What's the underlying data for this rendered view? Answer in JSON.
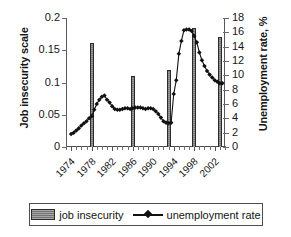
{
  "chart_data": {
    "type": "bar",
    "title": "",
    "subtitle": "",
    "xlabel": "",
    "ylabel": "Job insecurity scale",
    "y2label": "Unemployment rate, %",
    "grid": false,
    "legend_position": "bottom",
    "x_axis": {
      "tick_labels": [
        "1974",
        "1978",
        "1982",
        "1986",
        "1990",
        "1994",
        "1998",
        "2002"
      ],
      "tick_years": [
        1974,
        1978,
        1982,
        1986,
        1990,
        1994,
        1998,
        2002
      ],
      "range": [
        1973,
        2004
      ],
      "minor_tick_interval": 1
    },
    "y_axis_left": {
      "tick_labels": [
        "0",
        "0.05",
        "0.1",
        "0.15",
        "0.2"
      ],
      "tick_values": [
        0,
        0.05,
        0.1,
        0.15,
        0.2
      ],
      "ylim": [
        0,
        0.2
      ]
    },
    "y_axis_right": {
      "tick_labels": [
        "0",
        "2",
        "4",
        "6",
        "8",
        "10",
        "12",
        "14",
        "16",
        "18"
      ],
      "tick_values": [
        0,
        2,
        4,
        6,
        8,
        10,
        12,
        14,
        16,
        18
      ],
      "ylim": [
        0,
        18
      ]
    },
    "series": [
      {
        "name": "job insecurity",
        "type": "bar",
        "axis": "left",
        "x": [
          1978,
          1986,
          1993,
          1998,
          2003
        ],
        "values": [
          0.161,
          0.11,
          0.12,
          0.185,
          0.17
        ]
      },
      {
        "name": "unemployment rate",
        "type": "line",
        "axis": "right",
        "marker": "diamond",
        "x": [
          1974,
          1974.5,
          1975,
          1975.5,
          1976,
          1976.5,
          1977,
          1977.5,
          1978,
          1978.5,
          1979,
          1979.5,
          1980,
          1980.5,
          1981,
          1981.5,
          1982,
          1982.5,
          1983,
          1983.5,
          1984,
          1984.5,
          1985,
          1985.5,
          1986,
          1986.5,
          1987,
          1987.5,
          1988,
          1988.5,
          1989,
          1989.5,
          1990,
          1990.5,
          1991,
          1991.5,
          1992,
          1992.5,
          1993,
          1993.5,
          1994,
          1994.5,
          1995,
          1995.5,
          1996,
          1996.5,
          1997,
          1997.5,
          1998,
          1998.5,
          1999,
          1999.5,
          2000,
          2000.5,
          2001,
          2001.5,
          2002,
          2002.5,
          2003,
          2003.5
        ],
        "values": [
          1.8,
          2.0,
          2.3,
          2.6,
          3.0,
          3.3,
          3.6,
          4.0,
          4.3,
          5.2,
          6.0,
          6.6,
          7.0,
          7.2,
          6.6,
          6.2,
          5.7,
          5.3,
          5.2,
          5.2,
          5.3,
          5.4,
          5.4,
          5.3,
          5.4,
          5.5,
          5.5,
          5.5,
          5.4,
          5.3,
          5.4,
          5.4,
          5.3,
          5.0,
          4.6,
          4.1,
          3.6,
          3.4,
          3.3,
          3.4,
          7.4,
          9.3,
          13.0,
          14.8,
          16.3,
          16.4,
          16.4,
          16.2,
          15.5,
          14.6,
          13.2,
          12.1,
          11.3,
          10.6,
          10.1,
          9.7,
          9.3,
          9.1,
          8.9,
          8.9
        ]
      }
    ],
    "colors": {
      "bar_fill": "#8f8f8f",
      "bar_edge": "#2b2b2b",
      "line": "#111111",
      "marker": "#111111",
      "axis": "#5a5a5a",
      "text": "#161616",
      "background": "#ffffff"
    }
  },
  "legend": {
    "entries": [
      {
        "label": "job insecurity",
        "swatch": "bar-swatch-icon"
      },
      {
        "label": "unemployment rate",
        "swatch": "line-marker-icon"
      }
    ]
  }
}
